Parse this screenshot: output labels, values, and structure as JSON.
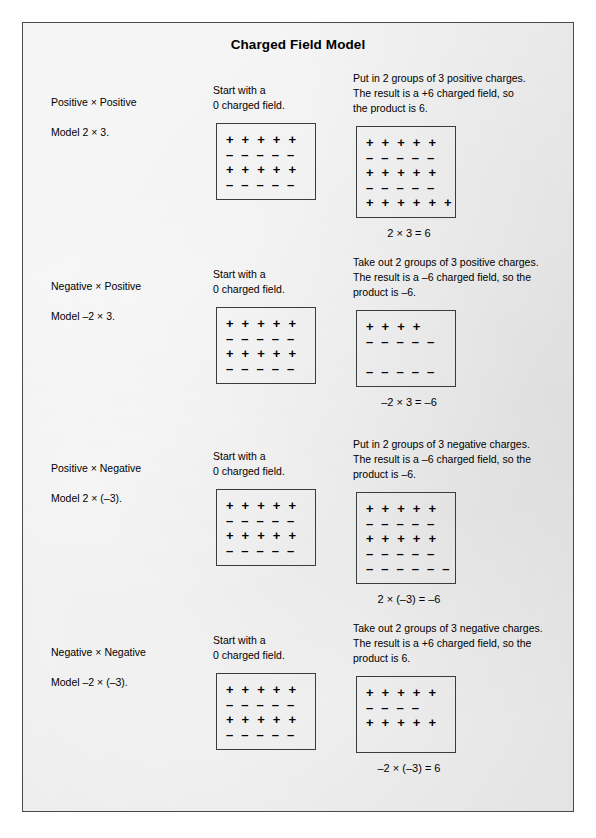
{
  "document": {
    "title": "Charged Field Model",
    "background_color": "#e9e9e9",
    "border_color": "#4a4a4a",
    "caption": ""
  },
  "glyphs": {
    "plus": "+",
    "minus": "–",
    "times": "×"
  },
  "sections": [
    {
      "id": "positive-times-positive",
      "heading": "Positive ×  Positive",
      "model": "Model 2 × 3.",
      "start_caption_line1": "Start with a",
      "start_caption_line2": "0 charged field.",
      "action_line1": "Put in 2 groups of 3 positive charges.",
      "action_line2": "The result is a +6 charged field, so",
      "action_line3": "the product is 6.",
      "equation": "2 × 3 = 6",
      "start_rows": [
        "+ + + + +",
        "– – – – –",
        "+ + + + +",
        "– – – – –"
      ],
      "result_rows": [
        "+ + + + +",
        "– – – – –",
        "+ + + + +",
        "– – – – –",
        "+ + +  + + +"
      ]
    },
    {
      "id": "negative-times-positive",
      "heading": "Negative ×  Positive",
      "model": "Model –2 × 3.",
      "start_caption_line1": "Start with a",
      "start_caption_line2": "0 charged field.",
      "action_line1": "Take out 2 groups of 3 positive charges.",
      "action_line2": "The result is a –6 charged field, so the",
      "action_line3": "product is –6.",
      "equation": "–2 × 3 = –6",
      "start_rows": [
        "+ + + + +",
        "– – – – –",
        "+ + + + +",
        "– – – – –"
      ],
      "result_rows": [
        "+ + + +",
        "– – – – –",
        "",
        "– – – – –"
      ]
    },
    {
      "id": "positive-times-negative",
      "heading": "Positive × Negative",
      "model": "Model 2 × (–3).",
      "start_caption_line1": "Start with a",
      "start_caption_line2": "0 charged field.",
      "action_line1": "Put in 2 groups of 3 negative charges.",
      "action_line2": "The result is a –6 charged field, so the",
      "action_line3": "product is –6.",
      "equation": "2 × (–3) = –6",
      "start_rows": [
        "+ + + + +",
        "– – – – –",
        "+ + + + +",
        "– – – – –"
      ],
      "result_rows": [
        "+ + + + +",
        "– – – – –",
        "+ + + + +",
        "– – – – –",
        "– – –  – – –"
      ]
    },
    {
      "id": "negative-times-negative",
      "heading": "Negative × Negative",
      "model": "Model –2 × (–3).",
      "start_caption_line1": "Start with a",
      "start_caption_line2": "0 charged field.",
      "action_line1": "Take out 2 groups of 3 negative charges.",
      "action_line2": "The result is a +6 charged field, so the",
      "action_line3": "product is 6.",
      "equation": "–2 × (–3) = 6",
      "start_rows": [
        "+ + + + +",
        "– – – – –",
        "+ + + + +",
        "– – – – –"
      ],
      "result_rows": [
        "+ + + + +",
        "– – – –",
        "+ + + + +",
        ""
      ]
    }
  ]
}
